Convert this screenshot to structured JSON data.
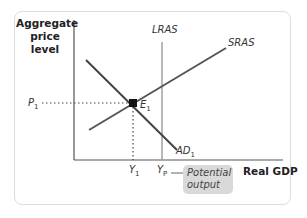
{
  "diagram": {
    "y_axis_label": "Aggregate price level",
    "x_axis_label": "Real GDP",
    "curves": {
      "lras": "LRAS",
      "sras": "SRAS",
      "ad": "AD",
      "ad_sub": "1"
    },
    "equilibrium": {
      "label": "E",
      "sub": "1"
    },
    "price_tick": {
      "label": "P",
      "sub": "1"
    },
    "gdp_ticks": [
      {
        "label": "Y",
        "sub": "1"
      },
      {
        "label": "Y",
        "sub": "P"
      }
    ],
    "callout": "Potential output",
    "colors": {
      "curve": "#444444",
      "lras": "#9a9a9a",
      "axis": "#555555",
      "callout_bg": "#d9d9d9"
    }
  }
}
